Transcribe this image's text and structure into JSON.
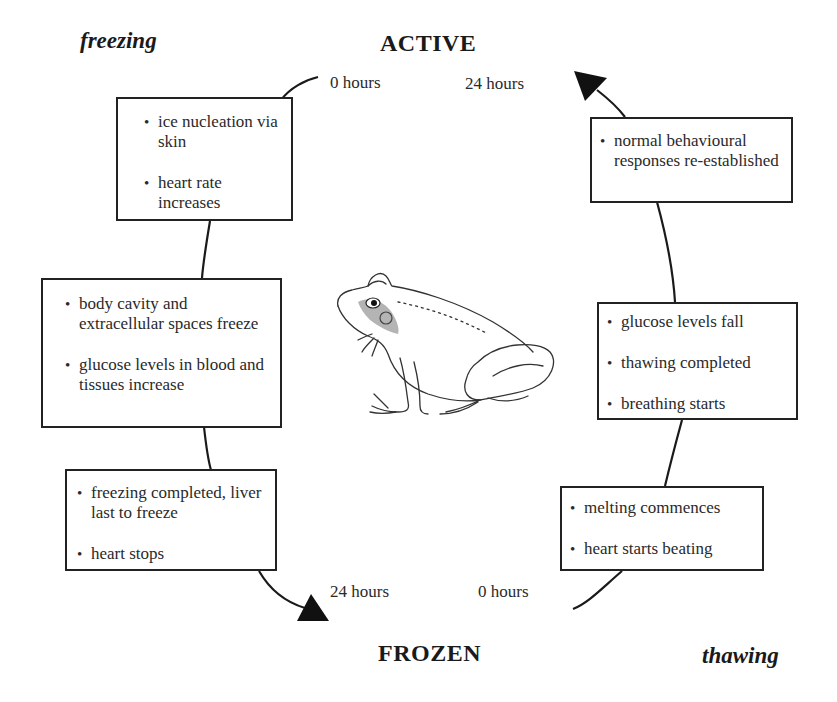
{
  "diagram": {
    "type": "cycle",
    "title_top": "ACTIVE",
    "title_bottom": "FROZEN",
    "phase_left": "freezing",
    "phase_right": "thawing",
    "time_labels": {
      "top_left": "0 hours",
      "top_right": "24 hours",
      "bottom_left": "24 hours",
      "bottom_right": "0 hours"
    },
    "freezing_steps": [
      {
        "items": [
          "ice nucleation via skin",
          "heart rate increases"
        ]
      },
      {
        "items": [
          "body cavity and extracellular spaces freeze",
          "glucose levels in blood and tissues increase"
        ]
      },
      {
        "items": [
          "freezing completed, liver last to freeze",
          "heart stops"
        ]
      }
    ],
    "thawing_steps": [
      {
        "items": [
          "melting commences",
          "heart starts beating"
        ]
      },
      {
        "items": [
          "glucose levels fall",
          "thawing completed",
          "breathing starts"
        ]
      },
      {
        "items": [
          "normal behavioural responses re-established"
        ]
      }
    ],
    "illustration": "frog-drawing",
    "colors": {
      "line": "#1a1a1a",
      "box_border": "#222222",
      "background": "#ffffff"
    }
  }
}
